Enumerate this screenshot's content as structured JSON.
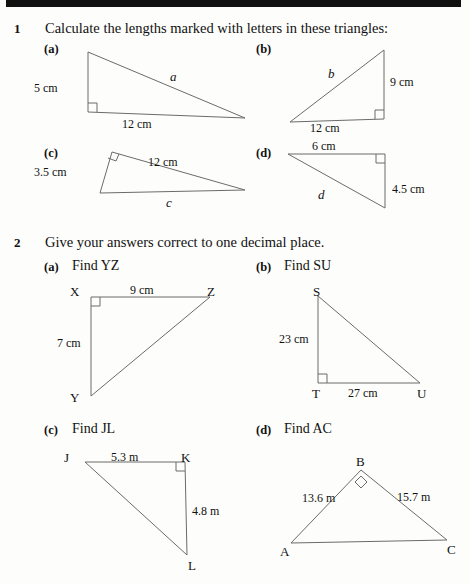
{
  "page": {
    "background_color": "#fdfdfb",
    "ink_color": "#111111",
    "line_color": "#6b6b6b",
    "top_bar_color": "#111111"
  },
  "questions": [
    {
      "number": "1",
      "prompt": "Calculate the lengths marked with letters in these triangles:",
      "parts": [
        {
          "label": "(a)",
          "figure": {
            "kind": "right-triangle",
            "vertices": {
              "top_left": [
                12,
                6
              ],
              "bottom_left": [
                12,
                66
              ],
              "bottom_right": [
                169,
                72
              ]
            },
            "right_angle_at": "bottom_left",
            "labels": {
              "vertical_side": "5 cm",
              "horizontal_side": "12 cm",
              "hypotenuse": "a"
            }
          }
        },
        {
          "label": "(b)",
          "figure": {
            "kind": "right-triangle",
            "vertices": {
              "top_right": [
                100,
                4
              ],
              "bottom_right": [
                100,
                73
              ],
              "bottom_left": [
                6,
                76
              ]
            },
            "right_angle_at": "bottom_right",
            "labels": {
              "vertical_side": "9 cm",
              "horizontal_side": "12 cm",
              "hypotenuse": "b"
            }
          }
        },
        {
          "label": "(c)",
          "figure": {
            "kind": "right-triangle",
            "vertices": {
              "apex": [
                18,
                8
              ],
              "bottom_left": [
                6,
                49
              ],
              "right": [
                151,
                46
              ]
            },
            "right_angle_at": "apex",
            "labels": {
              "short_side": "3.5 cm",
              "upper_side": "12 cm",
              "base": "c"
            }
          }
        },
        {
          "label": "(d)",
          "figure": {
            "kind": "right-triangle",
            "vertices": {
              "top_left": [
                6,
                6
              ],
              "top_right": [
                103,
                6
              ],
              "bottom_right": [
                103,
                60
              ]
            },
            "right_angle_at": "top_right",
            "labels": {
              "top_side": "6 cm",
              "vertical_side": "4.5 cm",
              "hypotenuse": "d"
            }
          }
        }
      ]
    },
    {
      "number": "2",
      "prompt": "Give your answers correct to one decimal place.",
      "parts": [
        {
          "label": "(a)",
          "text": "Find YZ",
          "figure": {
            "kind": "right-triangle",
            "vertices": {
              "X": [
                6,
                6
              ],
              "Z": [
                125,
                6
              ],
              "Y": [
                6,
                105
              ]
            },
            "right_angle_at": "X",
            "vertex_labels": {
              "X": "X",
              "Z": "Z",
              "Y": "Y"
            },
            "labels": {
              "top_side": "9 cm",
              "left_side": "7 cm"
            }
          }
        },
        {
          "label": "(b)",
          "text": "Find SU",
          "figure": {
            "kind": "right-triangle",
            "vertices": {
              "S": [
                6,
                6
              ],
              "T": [
                6,
                93
              ],
              "U": [
                108,
                93
              ]
            },
            "right_angle_at": "T",
            "vertex_labels": {
              "S": "S",
              "T": "T",
              "U": "U"
            },
            "labels": {
              "left_side": "23 cm",
              "bottom_side": "27 cm"
            }
          }
        },
        {
          "label": "(c)",
          "text": "Find JL",
          "figure": {
            "kind": "right-triangle",
            "vertices": {
              "J": [
                6,
                6
              ],
              "K": [
                106,
                6
              ],
              "L": [
                108,
                99
              ]
            },
            "right_angle_at": "K",
            "vertex_labels": {
              "J": "J",
              "K": "K",
              "L": "L"
            },
            "labels": {
              "top_side": "5.3 m",
              "right_side": "4.8 m"
            }
          }
        },
        {
          "label": "(d)",
          "text": "Find AC",
          "figure": {
            "kind": "right-triangle",
            "vertices": {
              "B": [
                76,
                8
              ],
              "A": [
                6,
                81
              ],
              "C": [
                162,
                78
              ]
            },
            "right_angle_at": "B",
            "vertex_labels": {
              "A": "A",
              "B": "B",
              "C": "C"
            },
            "labels": {
              "left_side": "13.6 m",
              "right_side": "15.7 m"
            }
          }
        }
      ]
    }
  ]
}
